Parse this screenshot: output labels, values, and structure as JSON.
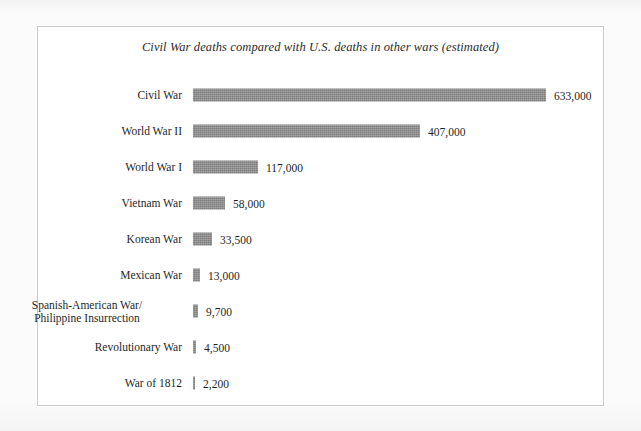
{
  "figure": {
    "title": "Civil War deaths compared with U.S. deaths in other wars (estimated)",
    "bar_color": "#8a8a8a",
    "frame_color": "#c9c9c9",
    "page_color": "#fbfbfb",
    "plot_color": "#ffffff"
  },
  "chart_data": {
    "type": "bar",
    "orientation": "horizontal",
    "title": "Civil War deaths compared with U.S. deaths in other wars (estimated)",
    "xlabel": "",
    "ylabel": "",
    "xlim": [
      0,
      633000
    ],
    "grid": false,
    "legend": null,
    "value_label_format": "comma-separated integers",
    "categories": [
      "Civil War",
      "World War II",
      "World War I",
      "Vietnam War",
      "Korean War",
      "Mexican War",
      "Spanish-American War/\nPhilippine Insurrection",
      "Revolutionary War",
      "War of 1812"
    ],
    "values": [
      633000,
      407000,
      117000,
      58000,
      33500,
      13000,
      9700,
      4500,
      2200
    ],
    "value_labels": [
      "633,000",
      "407,000",
      "117,000",
      "58,000",
      "33,500",
      "13,000",
      "9,700",
      "4,500",
      "2,200"
    ]
  }
}
